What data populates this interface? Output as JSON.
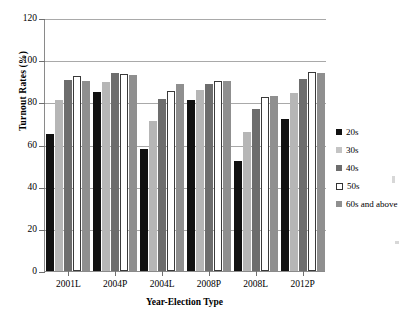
{
  "chart_data": {
    "type": "bar",
    "title": "",
    "xlabel": "Year-Election Type",
    "ylabel": "Turnout Rates (%)",
    "ylim": [
      0,
      120
    ],
    "ytick_labels": [
      "120",
      "100",
      "80",
      "60",
      "40",
      "20",
      "0"
    ],
    "ytick_values": [
      120,
      100,
      80,
      60,
      40,
      20,
      0
    ],
    "grid": true,
    "legend_position": "right",
    "categories": [
      "2001L",
      "2004P",
      "2004L",
      "2008P",
      "2008L",
      "2012P"
    ],
    "series": [
      {
        "name": "20s",
        "color": "#111111",
        "values": [
          65,
          85,
          58,
          81,
          52,
          72
        ]
      },
      {
        "name": "30s",
        "color": "#b6b6b6",
        "values": [
          81,
          89.5,
          71,
          86,
          66,
          84.5
        ]
      },
      {
        "name": "40s",
        "color": "#6d6d6d",
        "values": [
          90.5,
          94,
          81.5,
          88.5,
          77,
          91
        ]
      },
      {
        "name": "50s",
        "color": "#ffffff",
        "values": [
          92.5,
          93.5,
          85.5,
          90,
          82.5,
          94.5
        ]
      },
      {
        "name": "60s and above",
        "color": "#8f8f8f",
        "values": [
          90,
          93,
          88.5,
          90,
          83,
          94
        ]
      }
    ]
  },
  "legend": {
    "entries": [
      {
        "label": "20s"
      },
      {
        "label": "30s"
      },
      {
        "label": "40s"
      },
      {
        "label": "50s"
      },
      {
        "label": "60s and above"
      }
    ]
  }
}
